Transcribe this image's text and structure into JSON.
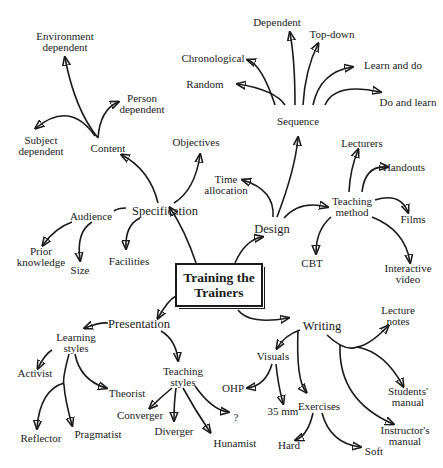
{
  "root": {
    "line1": "Training the",
    "line2": "Trainers"
  },
  "branches": {
    "specification": {
      "label": "Specification"
    },
    "content": {
      "label": "Content"
    },
    "environment_dependent": {
      "line1": "Environment",
      "line2": "dependent"
    },
    "person_dependent": {
      "line1": "Person",
      "line2": "dependent"
    },
    "subject_dependent": {
      "line1": "Subject",
      "line2": "dependent"
    },
    "objectives": {
      "label": "Objectives"
    },
    "audience": {
      "label": "Audience"
    },
    "prior_knowledge": {
      "line1": "Prior",
      "line2": "knowledge"
    },
    "size": {
      "label": "Size"
    },
    "facilities": {
      "label": "Facilities"
    },
    "design": {
      "label": "Design"
    },
    "time_allocation": {
      "line1": "Time",
      "line2": "allocation"
    },
    "sequence": {
      "label": "Sequence"
    },
    "dependent": {
      "label": "Dependent"
    },
    "top_down": {
      "label": "Top-down"
    },
    "chronological": {
      "label": "Chronological"
    },
    "random": {
      "label": "Random"
    },
    "learn_and_do": {
      "label": "Learn and do"
    },
    "do_and_learn": {
      "label": "Do and learn"
    },
    "teaching_method": {
      "line1": "Teaching",
      "line2": "method"
    },
    "lecturers": {
      "label": "Lecturers"
    },
    "handouts": {
      "label": "Handouts"
    },
    "films": {
      "label": "Films"
    },
    "interactive_video": {
      "line1": "Interactive",
      "line2": "video"
    },
    "cbt": {
      "label": "CBT"
    },
    "presentation": {
      "label": "Presentation"
    },
    "learning_styles": {
      "line1": "Learning",
      "line2": "styles"
    },
    "activist": {
      "label": "Activist"
    },
    "theorist": {
      "label": "Theorist"
    },
    "reflector": {
      "label": "Reflector"
    },
    "pragmatist": {
      "label": "Pragmatist"
    },
    "teaching_styles": {
      "line1": "Teaching",
      "line2": "styles"
    },
    "converger": {
      "label": "Converger"
    },
    "diverger": {
      "label": "Diverger"
    },
    "hunamist": {
      "label": "Hunamist"
    },
    "question": {
      "label": "?"
    },
    "writing": {
      "label": "Writing"
    },
    "visuals": {
      "label": "Visuals"
    },
    "ohp": {
      "label": "OHP"
    },
    "35mm": {
      "label": "35 mm"
    },
    "exercises": {
      "label": "Exercises"
    },
    "hard": {
      "label": "Hard"
    },
    "soft": {
      "label": "Soft"
    },
    "lecture_notes": {
      "line1": "Lecture",
      "line2": "notes"
    },
    "students_manual": {
      "line1": "Students'",
      "line2": "manual"
    },
    "instructors_manual": {
      "line1": "Instructor's",
      "line2": "manual"
    }
  },
  "colors": {
    "ink": "#1a1a1a",
    "background": "#ffffff"
  }
}
